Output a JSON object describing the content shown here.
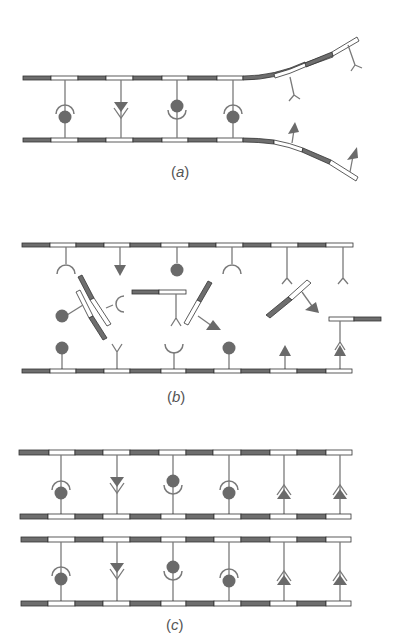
{
  "figure": {
    "panels": [
      {
        "id": "a",
        "label": "(a)",
        "description": "DNA double helix unwinding: complementary bases paired between two strands, strands separating at right"
      },
      {
        "id": "b",
        "label": "(b)",
        "description": "Free complementary nucleotides pairing with exposed bases on separated strands"
      },
      {
        "id": "c",
        "label": "(c)",
        "description": "Two identical daughter double helices after replication"
      }
    ],
    "base_shapes": [
      "circle",
      "cup",
      "triangle",
      "fork"
    ],
    "colors": {
      "dark_segment": "#6e6e6e",
      "light_segment": "#ffffff",
      "outline": "#333333",
      "base_fill": "#6a6a6a",
      "stem": "#7a7a7a",
      "label": "#555555"
    }
  }
}
